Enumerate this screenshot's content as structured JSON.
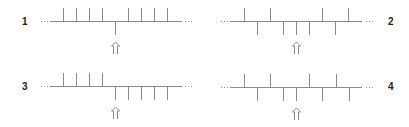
{
  "colors": {
    "line": "#8a8a8a",
    "tick": "#8a8a8a",
    "dots": "#8a8a8a",
    "arrow": "#7a7a7a",
    "label": "#222222"
  },
  "tick_spacing": 13,
  "diagrams": [
    {
      "label": "1",
      "label_pos": {
        "x": 22,
        "y": 17
      },
      "baseline_y": 21,
      "line_x": [
        50,
        182
      ],
      "dots_left_x": 41,
      "dots_right_x": 185,
      "ticks": [
        {
          "x": 63,
          "dir": "up"
        },
        {
          "x": 76,
          "dir": "up"
        },
        {
          "x": 89,
          "dir": "up"
        },
        {
          "x": 102,
          "dir": "up"
        },
        {
          "x": 115,
          "dir": "down"
        },
        {
          "x": 128,
          "dir": "up"
        },
        {
          "x": 141,
          "dir": "up"
        },
        {
          "x": 154,
          "dir": "up"
        },
        {
          "x": 167,
          "dir": "up"
        }
      ],
      "arrow_x": 115
    },
    {
      "label": "2",
      "label_pos": {
        "x": 388,
        "y": 17
      },
      "baseline_y": 21,
      "line_x": [
        230,
        362
      ],
      "dots_left_x": 221,
      "dots_right_x": 366,
      "ticks": [
        {
          "x": 244,
          "dir": "up"
        },
        {
          "x": 257,
          "dir": "down"
        },
        {
          "x": 270,
          "dir": "up"
        },
        {
          "x": 283,
          "dir": "down"
        },
        {
          "x": 296,
          "dir": "down"
        },
        {
          "x": 309,
          "dir": "down"
        },
        {
          "x": 322,
          "dir": "up"
        },
        {
          "x": 335,
          "dir": "down"
        },
        {
          "x": 348,
          "dir": "up"
        }
      ],
      "arrow_x": 296
    },
    {
      "label": "3",
      "label_pos": {
        "x": 22,
        "y": 82
      },
      "baseline_y": 86,
      "line_x": [
        50,
        182
      ],
      "dots_left_x": 41,
      "dots_right_x": 185,
      "ticks": [
        {
          "x": 63,
          "dir": "up"
        },
        {
          "x": 76,
          "dir": "up"
        },
        {
          "x": 89,
          "dir": "up"
        },
        {
          "x": 102,
          "dir": "up"
        },
        {
          "x": 115,
          "dir": "down"
        },
        {
          "x": 128,
          "dir": "down"
        },
        {
          "x": 141,
          "dir": "down"
        },
        {
          "x": 154,
          "dir": "down"
        },
        {
          "x": 167,
          "dir": "down"
        }
      ],
      "arrow_x": 115
    },
    {
      "label": "4",
      "label_pos": {
        "x": 388,
        "y": 82
      },
      "baseline_y": 87,
      "line_x": [
        230,
        362
      ],
      "dots_left_x": 221,
      "dots_right_x": 366,
      "ticks": [
        {
          "x": 244,
          "dir": "up"
        },
        {
          "x": 257,
          "dir": "down"
        },
        {
          "x": 270,
          "dir": "up"
        },
        {
          "x": 283,
          "dir": "down"
        },
        {
          "x": 296,
          "dir": "down"
        },
        {
          "x": 309,
          "dir": "up"
        },
        {
          "x": 322,
          "dir": "down"
        },
        {
          "x": 336,
          "dir": "up"
        },
        {
          "x": 349,
          "dir": "down"
        }
      ],
      "arrow_x": 296
    }
  ],
  "tick_length": 14,
  "arrow": {
    "offset_top": 21,
    "height": 12,
    "width": 8,
    "glyph": "double-up-arrow"
  }
}
